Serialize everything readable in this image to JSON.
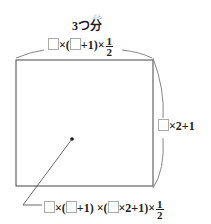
{
  "title": {
    "text": "3つ分",
    "ruby": "ぶん"
  },
  "top_formula": {
    "parts": [
      "×(",
      "+1)×"
    ],
    "frac_num": "1",
    "frac_den": "2"
  },
  "right_formula": {
    "text": "×2+1"
  },
  "bottom_formula": {
    "parts": [
      "×(",
      "+1) ×(",
      "×2+1)×"
    ],
    "frac_num": "1",
    "frac_den": "2"
  },
  "colors": {
    "line": "#444444",
    "brace": "#888888",
    "box_border": "#aaaaaa"
  }
}
